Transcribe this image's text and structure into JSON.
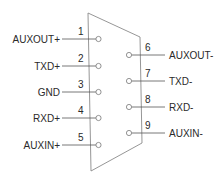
{
  "diagram": {
    "type": "DB9 connector pinout",
    "connector": {
      "outline_color": "#8a8a8a"
    },
    "left_pins": [
      {
        "number": "1",
        "label": "AUXOUT+",
        "y": 39
      },
      {
        "number": "2",
        "label": "TXD+",
        "y": 66
      },
      {
        "number": "3",
        "label": "GND",
        "y": 92
      },
      {
        "number": "4",
        "label": "RXD+",
        "y": 118
      },
      {
        "number": "5",
        "label": "AUXIN+",
        "y": 145
      }
    ],
    "right_pins": [
      {
        "number": "6",
        "label": "AUXOUT-",
        "y": 55
      },
      {
        "number": "7",
        "label": "TXD-",
        "y": 81
      },
      {
        "number": "8",
        "label": "RXD-",
        "y": 107
      },
      {
        "number": "9",
        "label": "AUXIN-",
        "y": 133
      }
    ]
  }
}
